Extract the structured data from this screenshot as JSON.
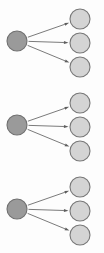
{
  "diagram": {
    "type": "node-link",
    "title": "",
    "canvas": {
      "width": 104,
      "height": 253,
      "background": "#fdfdfd"
    },
    "colors": {
      "source_fill": "#9a9a9a",
      "source_stroke": "#6f6f6f",
      "target_fill": "#d4d4d4",
      "target_stroke": "#777777",
      "edge": "#6b6b6b",
      "arrowhead": "#5d5d5d",
      "background": "#fdfdfd"
    },
    "geometry": {
      "source_radius": 10,
      "target_radius": 10,
      "source_x": 17,
      "target_x": 80
    },
    "groups": [
      {
        "id": "group-1",
        "label": "",
        "source": {
          "id": "source-1",
          "label": "",
          "cx": 17,
          "cy": 41
        },
        "targets": [
          {
            "id": "target-1-1",
            "label": "",
            "cx": 80,
            "cy": 19
          },
          {
            "id": "target-1-2",
            "label": "",
            "cx": 80,
            "cy": 43
          },
          {
            "id": "target-1-3",
            "label": "",
            "cx": 80,
            "cy": 67
          }
        ],
        "edges": [
          {
            "id": "edge-1-1",
            "from": "source-1",
            "to": "target-1-1",
            "label": ""
          },
          {
            "id": "edge-1-2",
            "from": "source-1",
            "to": "target-1-2",
            "label": ""
          },
          {
            "id": "edge-1-3",
            "from": "source-1",
            "to": "target-1-3",
            "label": ""
          }
        ]
      },
      {
        "id": "group-2",
        "label": "",
        "source": {
          "id": "source-2",
          "label": "",
          "cx": 17,
          "cy": 125
        },
        "targets": [
          {
            "id": "target-2-1",
            "label": "",
            "cx": 80,
            "cy": 103
          },
          {
            "id": "target-2-2",
            "label": "",
            "cx": 80,
            "cy": 127
          },
          {
            "id": "target-2-3",
            "label": "",
            "cx": 80,
            "cy": 151
          }
        ],
        "edges": [
          {
            "id": "edge-2-1",
            "from": "source-2",
            "to": "target-2-1",
            "label": ""
          },
          {
            "id": "edge-2-2",
            "from": "source-2",
            "to": "target-2-2",
            "label": ""
          },
          {
            "id": "edge-2-3",
            "from": "source-2",
            "to": "target-2-3",
            "label": ""
          }
        ]
      },
      {
        "id": "group-3",
        "label": "",
        "source": {
          "id": "source-3",
          "label": "",
          "cx": 17,
          "cy": 209
        },
        "targets": [
          {
            "id": "target-3-1",
            "label": "",
            "cx": 80,
            "cy": 187
          },
          {
            "id": "target-3-2",
            "label": "",
            "cx": 80,
            "cy": 211
          },
          {
            "id": "target-3-3",
            "label": "",
            "cx": 80,
            "cy": 235
          }
        ],
        "edges": [
          {
            "id": "edge-3-1",
            "from": "source-3",
            "to": "target-3-1",
            "label": ""
          },
          {
            "id": "edge-3-2",
            "from": "source-3",
            "to": "target-3-2",
            "label": ""
          },
          {
            "id": "edge-3-3",
            "from": "source-3",
            "to": "target-3-3",
            "label": ""
          }
        ]
      }
    ]
  }
}
